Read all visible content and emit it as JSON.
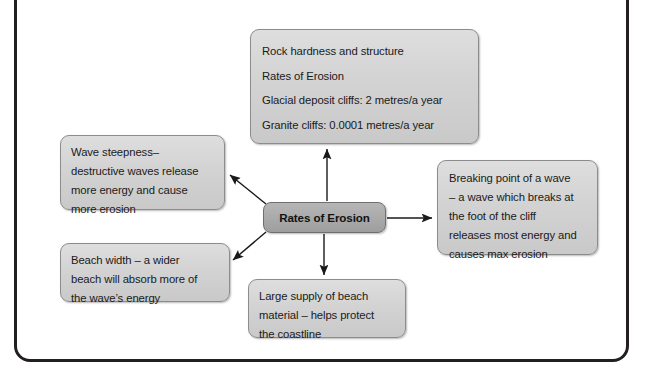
{
  "diagram": {
    "title": "Rates of Erosion",
    "center": {
      "label": "Rates of Erosion"
    },
    "nodes": {
      "rock_hardness": {
        "name": "rock-hardness-and-structure",
        "lines": [
          "Rock hardness and structure",
          "Rates of Erosion",
          "Glacial deposit cliffs: 2 metres/a year",
          "Granite cliffs: 0.0001 metres/a year"
        ]
      },
      "wave_steepness": {
        "name": "wave-steepness",
        "lines": [
          "Wave steepness–",
          "destructive waves release",
          "more energy and cause",
          "more erosion"
        ]
      },
      "beach_width": {
        "name": "beach-width",
        "lines": [
          "Beach width – a wider",
          "beach will absorb more of",
          "the wave’s energy"
        ]
      },
      "breaking_point": {
        "name": "breaking-point-of-a-wave",
        "lines": [
          "Breaking point of a wave",
          "– a wave which breaks at",
          "the foot of the cliff",
          "releases most energy and",
          "causes max erosion"
        ]
      },
      "large_supply": {
        "name": "large-supply-of-beach-material",
        "lines": [
          "Large supply of beach",
          "material – helps protect",
          "the coastline"
        ]
      }
    },
    "connectors": [
      {
        "name": "arrow-center-to-rock-hardness",
        "direction": "up"
      },
      {
        "name": "arrow-center-to-breaking-point",
        "direction": "right"
      },
      {
        "name": "arrow-center-to-large-supply",
        "direction": "down"
      },
      {
        "name": "arrow-center-to-wave-steepness",
        "direction": "up-left"
      },
      {
        "name": "arrow-center-to-beach-width",
        "direction": "down-left"
      }
    ],
    "colors": {
      "node_fill": "#d3d3d3",
      "node_border": "#8c8c8c",
      "center_fill": "#aaaaaa",
      "center_border": "#6f6f6f",
      "frame_border": "#231f20",
      "text": "#1a1a1a",
      "arrow": "#1a1a1a"
    }
  }
}
